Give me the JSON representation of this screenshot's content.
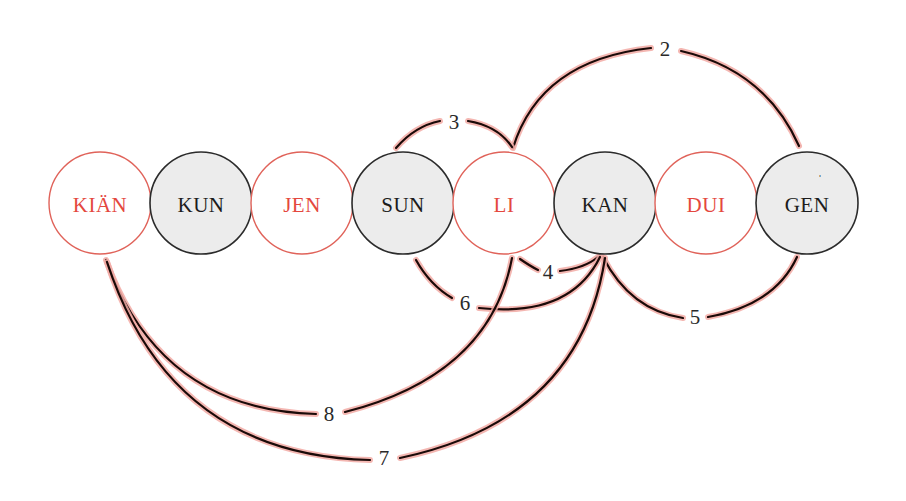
{
  "diagram": {
    "colors": {
      "red_stroke": "#e0635a",
      "red_text": "#e4483e",
      "dark_stroke": "#2b2b2b",
      "dark_text": "#1c1c1c",
      "dark_fill": "#ececec",
      "light_fill": "#ffffff",
      "arc_line": "#1a0a08",
      "arc_glow": "#f2aaa4"
    },
    "nodes": [
      {
        "id": "kian",
        "label": "KIÄN",
        "type": "red",
        "cx": 100,
        "cy": 203,
        "r": 51
      },
      {
        "id": "kun",
        "label": "KUN",
        "type": "dark",
        "cx": 201,
        "cy": 203,
        "r": 51
      },
      {
        "id": "jen",
        "label": "JEN",
        "type": "red",
        "cx": 302,
        "cy": 203,
        "r": 51
      },
      {
        "id": "sun",
        "label": "SUN",
        "type": "dark",
        "cx": 403,
        "cy": 203,
        "r": 51
      },
      {
        "id": "li",
        "label": "LI",
        "type": "red",
        "cx": 504,
        "cy": 203,
        "r": 51
      },
      {
        "id": "kan",
        "label": "KAN",
        "type": "dark",
        "cx": 605,
        "cy": 203,
        "r": 51
      },
      {
        "id": "dui",
        "label": "DUI",
        "type": "red",
        "cx": 706,
        "cy": 203,
        "r": 51
      },
      {
        "id": "gen",
        "label": "GEN",
        "type": "dark",
        "cx": 807,
        "cy": 203,
        "r": 51
      }
    ],
    "arcs": [
      {
        "label": "2",
        "from": "LI",
        "to": "GEN",
        "side": "top",
        "label_x": 665,
        "label_y": 49
      },
      {
        "label": "3",
        "from": "SUN",
        "to": "LI",
        "side": "top",
        "label_x": 454,
        "label_y": 122
      },
      {
        "label": "4",
        "from": "LI",
        "to": "KAN",
        "side": "bottom",
        "label_x": 548,
        "label_y": 272
      },
      {
        "label": "5",
        "from": "KAN",
        "to": "GEN",
        "side": "bottom",
        "label_x": 695,
        "label_y": 317
      },
      {
        "label": "6",
        "from": "SUN",
        "to": "KAN",
        "side": "bottom",
        "label_x": 465,
        "label_y": 303
      },
      {
        "label": "7",
        "from": "KIÄN",
        "to": "KAN",
        "side": "bottom",
        "label_x": 384,
        "label_y": 458
      },
      {
        "label": "8",
        "from": "KIÄN",
        "to": "LI",
        "side": "bottom",
        "label_x": 329,
        "label_y": 414
      }
    ],
    "gen_mark": "ˈ"
  }
}
